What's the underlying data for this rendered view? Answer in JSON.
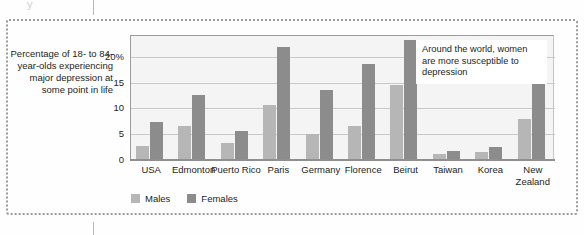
{
  "figure": {
    "caption": "Percentage of 18- to 84-year-olds experiencing major depression at some point in life",
    "crop_glyph": "y",
    "annotation": "Around the world, women are more susceptible to depression"
  },
  "legend": {
    "position": "bottom-left",
    "items": [
      {
        "label": "Males",
        "color": "#b6b6b6"
      },
      {
        "label": "Females",
        "color": "#8c8c8c"
      }
    ]
  },
  "axis": {
    "y_ticks": [
      "20%",
      "15",
      "10",
      "5",
      "0"
    ],
    "y_tick_values": [
      20,
      15,
      10,
      5,
      0
    ]
  },
  "chart_data": {
    "type": "bar",
    "title": "",
    "subtitle": "",
    "xlabel": "",
    "ylabel": "Percentage of 18- to 84-year-olds experiencing major depression at some point in life",
    "ylim": [
      0,
      24
    ],
    "yticks": [
      0,
      5,
      10,
      15,
      20
    ],
    "ytick_labels": [
      "0",
      "5",
      "10",
      "15",
      "20%"
    ],
    "grid": true,
    "legend_position": "bottom-left",
    "categories": [
      "USA",
      "Edmonton",
      "Puerto Rico",
      "Paris",
      "Germany",
      "Florence",
      "Beirut",
      "Taiwan",
      "Korea",
      "New Zealand"
    ],
    "series": [
      {
        "name": "Males",
        "color": "#b6b6b6",
        "values": [
          2.7,
          6.5,
          3.2,
          10.6,
          5.0,
          6.5,
          14.6,
          1.1,
          1.6,
          8.0
        ]
      },
      {
        "name": "Females",
        "color": "#8c8c8c",
        "values": [
          7.3,
          12.5,
          5.6,
          21.8,
          13.6,
          18.5,
          23.2,
          1.8,
          2.6,
          15.6
        ]
      }
    ],
    "annotations": [
      {
        "text": "Around the world, women are more susceptible to depression",
        "x": "Beirut",
        "y": 21
      }
    ]
  }
}
